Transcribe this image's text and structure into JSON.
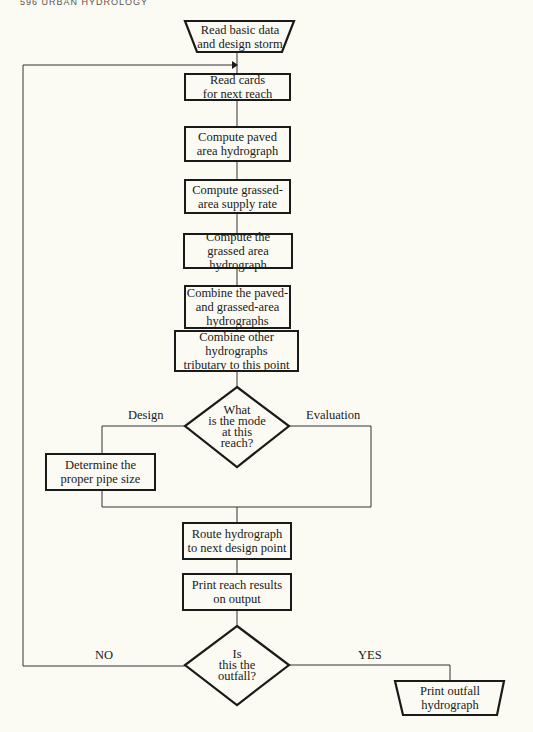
{
  "header": {
    "text": "596   URBAN HYDROLOGY"
  },
  "flowchart": {
    "start": {
      "label_line1": "Read basic data",
      "label_line2": "and design storm"
    },
    "steps": [
      {
        "line1": "Read cards",
        "line2": "for next reach",
        "line3": ""
      },
      {
        "line1": "Compute paved",
        "line2": "area hydrograph",
        "line3": ""
      },
      {
        "line1": "Compute grassed-",
        "line2": "area supply rate",
        "line3": ""
      },
      {
        "line1": "Compute the",
        "line2": "grassed area hydrograph",
        "line3": ""
      },
      {
        "line1": "Combine the paved-",
        "line2": "and grassed-area",
        "line3": "hydrographs"
      },
      {
        "line1": "Combine other hydrographs",
        "line2": "tributary to this point",
        "line3": ""
      }
    ],
    "decision_mode": {
      "line1": "What",
      "line2": "is the mode",
      "line3": "at this",
      "line4": "reach?",
      "left_label": "Design",
      "right_label": "Evaluation"
    },
    "design_step": {
      "line1": "Determine the",
      "line2": "proper pipe size"
    },
    "after_steps": [
      {
        "line1": "Route hydrograph",
        "line2": "to next design point"
      },
      {
        "line1": "Print reach results",
        "line2": "on output"
      }
    ],
    "decision_outfall": {
      "line1": "Is",
      "line2": "this the",
      "line3": "outfall?",
      "no_label": "NO",
      "yes_label": "YES"
    },
    "end": {
      "label_line1": "Print outfall",
      "label_line2": "hydrograph"
    }
  }
}
